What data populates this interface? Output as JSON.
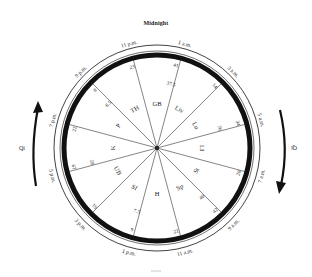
{
  "title": "Midnight",
  "caption": "noon",
  "center": {
    "x": 157,
    "y": 148
  },
  "colors": {
    "ring": "#111111",
    "spoke": "#333333",
    "text": "#222222",
    "arrow": "#111111"
  },
  "qi_left": {
    "label": "Qi",
    "direction": "up"
  },
  "qi_right": {
    "label": "Qi",
    "direction": "down"
  },
  "hours": [
    {
      "label": "1 a.m.",
      "angle": 15
    },
    {
      "label": "3 a.m.",
      "angle": 45
    },
    {
      "label": "5 a.m.",
      "angle": 75
    },
    {
      "label": "7 a.m.",
      "angle": 105
    },
    {
      "label": "9 a.m.",
      "angle": 135
    },
    {
      "label": "11 a.m.",
      "angle": 165
    },
    {
      "label": "1 p.m.",
      "angle": 195
    },
    {
      "label": "3 p.m.",
      "angle": 225
    },
    {
      "label": "5 p.m.",
      "angle": 255
    },
    {
      "label": "7 p.m.",
      "angle": 285
    },
    {
      "label": "9 p.m.",
      "angle": 315
    },
    {
      "label": "11 p.m.",
      "angle": 345
    }
  ],
  "spokes": [
    {
      "angle": 15,
      "outer_num": "41",
      "inner_num": "37.5"
    },
    {
      "angle": 45,
      "outer_num": "14",
      "inner_num": ""
    },
    {
      "angle": 75,
      "outer_num": "34",
      "inner_num": "76"
    },
    {
      "angle": 105,
      "outer_num": "20",
      "inner_num": ""
    },
    {
      "angle": 135,
      "outer_num": "42",
      "inner_num": "40"
    },
    {
      "angle": 165,
      "outer_num": "21",
      "inner_num": ""
    },
    {
      "angle": 195,
      "outer_num": "9",
      "inner_num": "7.5"
    },
    {
      "angle": 225,
      "outer_num": "19",
      "inner_num": ""
    },
    {
      "angle": 255,
      "outer_num": "67",
      "inner_num": "58"
    },
    {
      "angle": 285,
      "outer_num": "22",
      "inner_num": ""
    },
    {
      "angle": 315,
      "outer_num": "8",
      "inner_num": "6.5"
    },
    {
      "angle": 345,
      "outer_num": "23",
      "inner_num": ""
    }
  ],
  "organs": [
    {
      "label": "GB",
      "angle": 0
    },
    {
      "label": "Liv",
      "angle": 30
    },
    {
      "label": "Lu",
      "angle": 60
    },
    {
      "label": "LI",
      "angle": 90
    },
    {
      "label": "St",
      "angle": 120
    },
    {
      "label": "Sp",
      "angle": 150
    },
    {
      "label": "H",
      "angle": 180
    },
    {
      "label": "SI",
      "angle": 210
    },
    {
      "label": "UB",
      "angle": 240
    },
    {
      "label": "K",
      "angle": 270
    },
    {
      "label": "P",
      "angle": 300
    },
    {
      "label": "TH",
      "angle": 330
    }
  ]
}
